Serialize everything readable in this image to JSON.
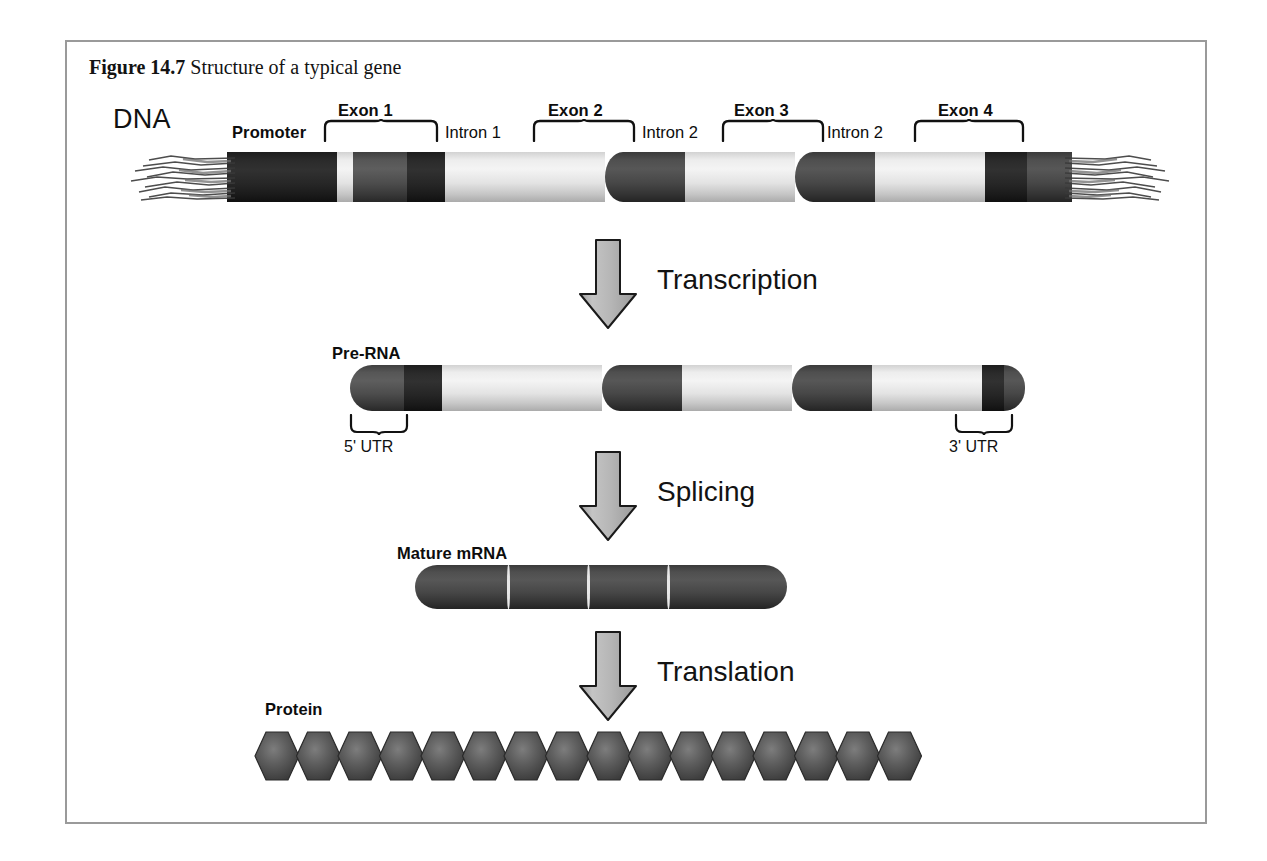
{
  "figure": {
    "number": "Figure 14.7",
    "caption": "Structure of a typical gene"
  },
  "rows": {
    "dna": {
      "label": "DNA",
      "segments": [
        {
          "name": "Promoter",
          "kind": "promoter"
        },
        {
          "name": "Exon 1",
          "kind": "exon"
        },
        {
          "name": "Intron 1",
          "kind": "intron"
        },
        {
          "name": "Exon 2",
          "kind": "exon"
        },
        {
          "name": "Intron 2",
          "kind": "intron"
        },
        {
          "name": "Exon 3",
          "kind": "exon"
        },
        {
          "name": "Intron 2",
          "kind": "intron"
        },
        {
          "name": "Exon 4",
          "kind": "exon"
        }
      ],
      "labels": {
        "promoter": "Promoter",
        "exon1": "Exon 1",
        "intron1": "Intron 1",
        "exon2": "Exon 2",
        "intron2": "Intron 2",
        "exon3": "Exon 3",
        "intron3": "Intron 2",
        "exon4": "Exon 4"
      }
    },
    "prerna": {
      "label": "Pre-RNA",
      "utr5": "5' UTR",
      "utr3": "3' UTR"
    },
    "mrna": {
      "label": "Mature mRNA",
      "exon_count": 4
    },
    "protein": {
      "label": "Protein",
      "residue_count": 16
    }
  },
  "processes": [
    {
      "label": "Transcription"
    },
    {
      "label": "Splicing"
    },
    {
      "label": "Translation"
    }
  ],
  "colors": {
    "frame_border": "#9a9a9a",
    "exon_dark": "#4a4a4a",
    "promoter_black": "#1f1f1f",
    "intron_light": "#ededed",
    "arrow_fill": "#b0b0b0",
    "arrow_stroke": "#1a1a1a",
    "protein_hex": "#4d4d4d",
    "text": "#111111",
    "page_background": "#ffffff"
  }
}
